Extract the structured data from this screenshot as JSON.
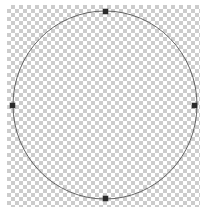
{
  "canvas": {
    "width": 207,
    "height": 218,
    "background_color": "#ffffff",
    "label": "transparent-canvas"
  },
  "checkerboard": {
    "label": "transparency-checkerboard",
    "x": 7,
    "y": 5,
    "width": 193,
    "height": 202,
    "cell_size_px": 4,
    "light_color": "#ffffff",
    "dark_color": "#cccccc"
  },
  "shape": {
    "type": "ellipse",
    "label": "circle-shape",
    "center_x": 105,
    "center_y": 105,
    "radius_x": 92,
    "radius_y": 94,
    "stroke_color": "#565656",
    "stroke_width": 0.9,
    "fill": "none",
    "selected": true
  },
  "selection": {
    "label": "selection-handles",
    "handle_color": "#2b2b2b",
    "handle_size_px": 5,
    "handles": [
      {
        "name": "top",
        "x": 105,
        "y": 11,
        "cursor": "n-resize"
      },
      {
        "name": "left",
        "x": 12,
        "y": 105,
        "cursor": "w-resize"
      },
      {
        "name": "right",
        "x": 194,
        "y": 105,
        "cursor": "e-resize"
      },
      {
        "name": "bottom",
        "x": 105,
        "y": 198,
        "cursor": "s-resize"
      }
    ]
  }
}
